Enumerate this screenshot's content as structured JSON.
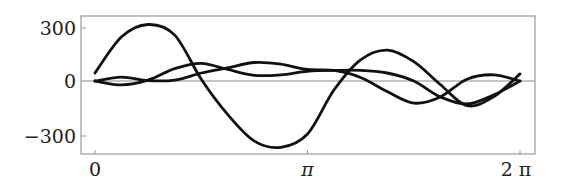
{
  "chart_data": {
    "type": "line",
    "title": "",
    "xlabel": "",
    "ylabel": "",
    "xlim": [
      0,
      6.2832
    ],
    "ylim": [
      -400,
      370
    ],
    "grid": false,
    "legend": null,
    "x_ticks": [
      {
        "value": 0,
        "label": "0"
      },
      {
        "value": 3.1416,
        "label": "π"
      },
      {
        "value": 6.2832,
        "label": "2 π"
      }
    ],
    "y_ticks": [
      {
        "value": 300,
        "label": "300"
      },
      {
        "value": 0,
        "label": "0"
      },
      {
        "value": -300,
        "label": "−300"
      }
    ],
    "reference_lines": [
      {
        "axis": "y",
        "value": 0
      }
    ],
    "x": [
      0,
      0.3927,
      0.7854,
      1.1781,
      1.5708,
      1.9635,
      2.3562,
      2.7489,
      3.1416,
      3.5343,
      3.927,
      4.3197,
      4.7124,
      5.1051,
      5.4978,
      5.8905,
      6.2832
    ],
    "x_labels": [
      "0",
      "π/8",
      "π/4",
      "3π/8",
      "π/2",
      "5π/8",
      "3π/4",
      "7π/8",
      "π",
      "9π/8",
      "5π/4",
      "11π/8",
      "3π/2",
      "13π/8",
      "7π/4",
      "15π/8",
      "2π"
    ],
    "series": [
      {
        "name": "curve-1",
        "color": "#111111",
        "values": [
          45,
          250,
          320,
          260,
          10,
          -190,
          -340,
          -375,
          -300,
          -50,
          120,
          175,
          110,
          -20,
          -140,
          -90,
          40
        ]
      },
      {
        "name": "curve-2",
        "color": "#111111",
        "values": [
          0,
          -22,
          5,
          70,
          100,
          65,
          32,
          35,
          55,
          60,
          60,
          45,
          0,
          -90,
          -130,
          -80,
          0
        ]
      },
      {
        "name": "curve-3",
        "color": "#111111",
        "values": [
          0,
          22,
          2,
          5,
          45,
          75,
          105,
          95,
          65,
          60,
          20,
          -60,
          -125,
          -90,
          10,
          35,
          0
        ]
      }
    ]
  },
  "labels": {
    "y300": "300",
    "y0": "0",
    "yneg300": "−300",
    "x0": "0",
    "xpi": "π",
    "x2pi": "2 π"
  }
}
